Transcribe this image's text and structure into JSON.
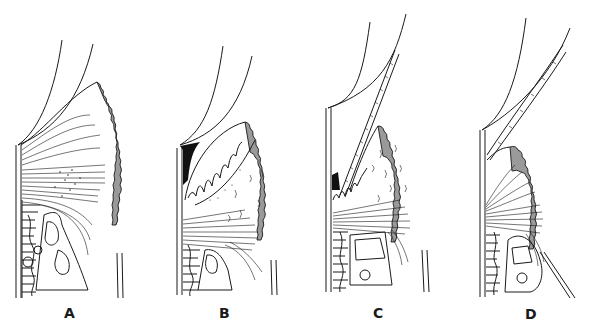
{
  "figure": {
    "type": "scientific line drawing",
    "panels": [
      {
        "id": "A",
        "label": "A",
        "x": 70
      },
      {
        "id": "B",
        "label": "B",
        "x": 225
      },
      {
        "id": "C",
        "label": "C",
        "x": 378
      },
      {
        "id": "D",
        "label": "D",
        "x": 531
      }
    ]
  },
  "colors": {
    "line": "#1a1a1a",
    "epithelium_fill": "#9a9a9a",
    "background": "#ffffff"
  }
}
